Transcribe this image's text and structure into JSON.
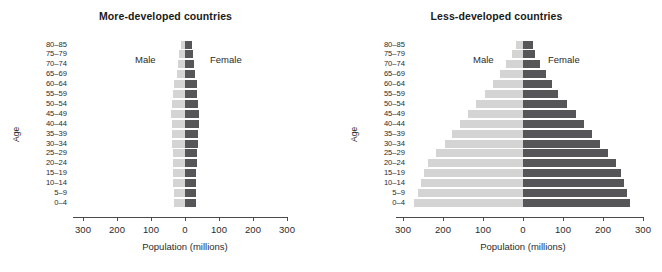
{
  "figure": {
    "background": "#ffffff",
    "male_color": "#d4d4d4",
    "female_color": "#565658",
    "axis_color": "#4a4a4a"
  },
  "chart_data": [
    {
      "type": "bar",
      "subtype": "population-pyramid",
      "title": "More-developed countries",
      "xlabel": "Population (millions)",
      "ylabel": "Age",
      "xlim": [
        -300,
        300
      ],
      "xticks": [
        300,
        200,
        100,
        0,
        100,
        200,
        300
      ],
      "grid": false,
      "legend_position": "inside-top",
      "categories": [
        "80–85",
        "75–79",
        "70–74",
        "65–69",
        "60–64",
        "55–59",
        "50–54",
        "45–49",
        "40–44",
        "35–39",
        "30–34",
        "25–29",
        "20–24",
        "15–19",
        "10–14",
        "5–9",
        "0–4"
      ],
      "series": [
        {
          "name": "Male",
          "side": "left",
          "color": "#d4d4d4",
          "values": [
            13,
            17,
            22,
            25,
            31,
            34,
            37,
            40,
            39,
            38,
            37,
            36,
            35,
            35,
            34,
            33,
            33
          ]
        },
        {
          "name": "Female",
          "side": "right",
          "color": "#565658",
          "values": [
            22,
            24,
            27,
            29,
            34,
            36,
            38,
            41,
            40,
            38,
            37,
            36,
            34,
            33,
            32,
            32,
            31
          ]
        }
      ]
    },
    {
      "type": "bar",
      "subtype": "population-pyramid",
      "title": "Less-developed countries",
      "xlabel": "Population (millions)",
      "ylabel": "Age",
      "xlim": [
        -300,
        300
      ],
      "xticks": [
        300,
        200,
        100,
        0,
        100,
        200,
        300
      ],
      "grid": false,
      "legend_position": "inside-top",
      "categories": [
        "80–85",
        "75–79",
        "70–74",
        "65–69",
        "60–64",
        "55–59",
        "50–54",
        "45–49",
        "40–44",
        "35–39",
        "30–34",
        "25–29",
        "20–24",
        "15–19",
        "10–14",
        "5–9",
        "0–4"
      ],
      "series": [
        {
          "name": "Male",
          "side": "left",
          "color": "#d4d4d4",
          "values": [
            18,
            28,
            43,
            58,
            75,
            95,
            118,
            138,
            158,
            178,
            196,
            218,
            238,
            248,
            255,
            262,
            272
          ]
        },
        {
          "name": "Female",
          "side": "right",
          "color": "#565658",
          "values": [
            25,
            30,
            43,
            58,
            73,
            88,
            110,
            132,
            152,
            172,
            192,
            212,
            232,
            244,
            252,
            260,
            267
          ]
        }
      ]
    }
  ]
}
